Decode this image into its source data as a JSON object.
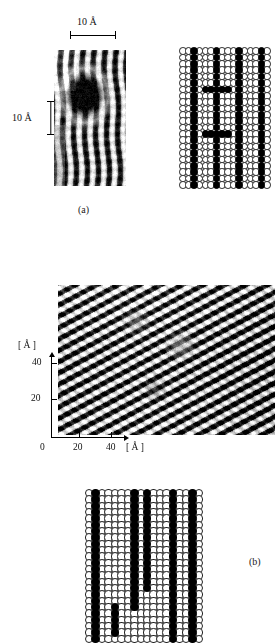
{
  "figure": {
    "type": "scientific-figure",
    "background_color": "#ffffff",
    "ink_color": "#000000"
  },
  "panel_a": {
    "letter": "(a)",
    "scale_bar_horizontal": {
      "label": "10 Å",
      "value": 10,
      "unit": "Å",
      "orientation": "horizontal"
    },
    "scale_bar_vertical": {
      "label": "10 Å",
      "value": 10,
      "unit": "Å",
      "orientation": "vertical"
    },
    "stm_image": {
      "name": "stm-image-a",
      "motif": "vertical bright and dark stripes with one large dark depression",
      "stripe_period_px": 11,
      "defect": {
        "shape": "dark-blob",
        "center_x_frac": 0.42,
        "center_y_frac": 0.33,
        "radius_x_frac": 0.21,
        "radius_y_frac": 0.13
      }
    },
    "ball_model": {
      "name": "ball-model-a",
      "columns": 16,
      "rows": 22,
      "filled_color": "#000000",
      "open_color": "#ffffff",
      "filled_columns": [
        2,
        6,
        10,
        14
      ],
      "extra_filled_cells": [
        [
          4,
          6
        ],
        [
          5,
          6
        ],
        [
          7,
          6
        ],
        [
          8,
          6
        ],
        [
          4,
          13
        ],
        [
          5,
          13
        ],
        [
          7,
          13
        ],
        [
          8,
          13
        ],
        [
          6,
          5
        ],
        [
          6,
          7
        ],
        [
          6,
          12
        ],
        [
          6,
          14
        ]
      ]
    }
  },
  "panel_b": {
    "letter": "(b)",
    "stm_image": {
      "name": "stm-image-b",
      "motif": "diagonal rows of bright protrusions, stripes running upper-right to lower-left",
      "stripe_angle_deg": 62,
      "stripe_period_px": 10
    },
    "axes": {
      "x_label": "[ Å ]",
      "y_label": "[ Å ]",
      "x_ticks": [
        "0",
        "20",
        "40"
      ],
      "x_tick_values": [
        0,
        20,
        40
      ],
      "y_ticks": [
        "20",
        "40"
      ],
      "y_tick_values": [
        20,
        40
      ],
      "x_range": [
        0,
        55
      ],
      "y_range": [
        0,
        50
      ],
      "unit": "Å"
    },
    "ball_model": {
      "name": "ball-model-b",
      "columns": 18,
      "rows": 24,
      "filled_color": "#000000",
      "open_color": "#ffffff",
      "filled_columns": [
        1,
        7,
        9,
        13,
        16
      ],
      "short_column": {
        "column": 4,
        "start_row": 18,
        "end_row": 23
      },
      "column_stops": {
        "7": 19,
        "9": 16,
        "13": 24,
        "16": 24,
        "1": 24
      }
    }
  }
}
